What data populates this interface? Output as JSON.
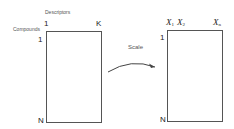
{
  "diagram": {
    "left_matrix": {
      "column_axis_label": "Descriptors",
      "row_axis_label": "Compounds",
      "first_column": "1",
      "last_column": "K",
      "first_row": "1",
      "last_row": "N"
    },
    "transform": {
      "label": "Scale",
      "arrow": "curved-arrow-right"
    },
    "right_matrix": {
      "col1_var": "X",
      "col1_sub": "1",
      "col2_var": "X",
      "col2_sub": "2",
      "last_col_var": "X",
      "last_col_sub": "n",
      "first_row": "1",
      "last_row": "N"
    },
    "colors": {
      "line": "#555555",
      "text": "#222222",
      "background": "#ffffff"
    }
  }
}
